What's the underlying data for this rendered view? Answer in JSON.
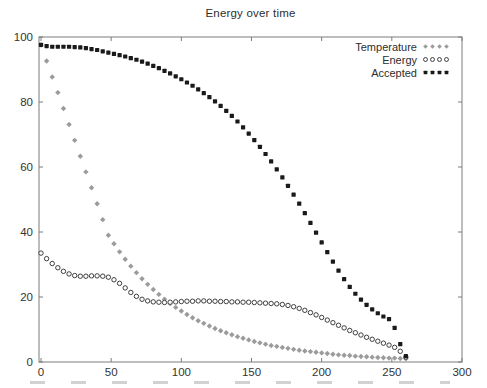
{
  "page": {
    "background": "#ffffff"
  },
  "chart_data": {
    "type": "scatter",
    "title": "Energy over time",
    "xlabel": "",
    "ylabel": "",
    "xlim": [
      0,
      300
    ],
    "ylim": [
      0,
      100
    ],
    "x_ticks": [
      0,
      50,
      100,
      150,
      200,
      250,
      300
    ],
    "y_ticks": [
      0,
      20,
      40,
      60,
      80,
      100
    ],
    "grid": false,
    "axis_color": "#7d7d7d",
    "text_color": "#333333",
    "legend": {
      "position": "top-right-inside",
      "entries": [
        "Temperature",
        "Energy",
        "Accepted"
      ]
    },
    "x": [
      0,
      4,
      8,
      12,
      16,
      20,
      24,
      28,
      32,
      36,
      40,
      44,
      48,
      52,
      56,
      60,
      64,
      68,
      72,
      76,
      80,
      84,
      88,
      92,
      96,
      100,
      104,
      108,
      112,
      116,
      120,
      124,
      128,
      132,
      136,
      140,
      144,
      148,
      152,
      156,
      160,
      164,
      168,
      172,
      176,
      180,
      184,
      188,
      192,
      196,
      200,
      204,
      208,
      212,
      216,
      220,
      224,
      228,
      232,
      236,
      240,
      244,
      248,
      252,
      256,
      260
    ],
    "series": [
      {
        "name": "Temperature",
        "marker": "diamond",
        "color": "#9b9b9b",
        "values": [
          97.5,
          92.6,
          87.7,
          82.9,
          78.0,
          73.1,
          68.2,
          63.3,
          58.5,
          53.6,
          48.7,
          43.8,
          39.0,
          36.4,
          33.9,
          31.6,
          29.5,
          27.5,
          25.6,
          23.9,
          22.3,
          20.8,
          19.3,
          18.0,
          16.8,
          15.7,
          14.6,
          13.6,
          12.7,
          11.9,
          11.1,
          10.3,
          9.6,
          9.0,
          8.4,
          7.8,
          7.3,
          6.8,
          6.3,
          5.9,
          5.5,
          5.1,
          4.8,
          4.5,
          4.2,
          3.9,
          3.6,
          3.4,
          3.2,
          3.0,
          2.8,
          2.6,
          2.4,
          2.2,
          2.1,
          2.0,
          1.8,
          1.7,
          1.6,
          1.5,
          1.4,
          1.3,
          1.2,
          1.2,
          1.1,
          1.0
        ]
      },
      {
        "name": "Energy",
        "marker": "open-circle",
        "color": "#2b2b2b",
        "values": [
          33.5,
          31.8,
          30.3,
          29.0,
          27.9,
          27.1,
          26.6,
          26.4,
          26.4,
          26.5,
          26.5,
          26.4,
          26.1,
          25.3,
          24.2,
          22.8,
          21.4,
          20.2,
          19.3,
          18.8,
          18.5,
          18.4,
          18.3,
          18.4,
          18.5,
          18.6,
          18.7,
          18.7,
          18.8,
          18.8,
          18.7,
          18.7,
          18.6,
          18.6,
          18.5,
          18.5,
          18.4,
          18.4,
          18.3,
          18.2,
          18.1,
          18.0,
          17.9,
          17.7,
          17.4,
          17.0,
          16.5,
          15.9,
          15.2,
          14.5,
          13.7,
          12.9,
          12.1,
          11.3,
          10.5,
          9.7,
          9.0,
          8.3,
          7.6,
          7.0,
          6.4,
          5.8,
          5.2,
          4.5,
          3.3,
          1.5
        ]
      },
      {
        "name": "Accepted",
        "marker": "filled-square",
        "color": "#1a1a1a",
        "values": [
          97.6,
          97.2,
          97.0,
          97.0,
          97.0,
          97.0,
          96.9,
          96.8,
          96.6,
          96.3,
          96.0,
          95.6,
          95.2,
          94.8,
          94.4,
          94.0,
          93.5,
          93.0,
          92.4,
          91.8,
          91.1,
          90.4,
          89.6,
          88.8,
          87.9,
          87.0,
          86.0,
          85.0,
          83.9,
          82.7,
          81.5,
          80.2,
          78.8,
          77.3,
          75.7,
          74.0,
          72.2,
          70.3,
          68.3,
          66.2,
          64.0,
          61.7,
          59.3,
          56.8,
          54.2,
          51.5,
          48.7,
          45.8,
          42.8,
          39.8,
          36.8,
          33.8,
          30.9,
          28.1,
          25.5,
          23.1,
          21.0,
          19.2,
          17.6,
          16.2,
          15.0,
          14.0,
          13.2,
          10.5,
          5.5,
          1.8
        ]
      }
    ]
  }
}
